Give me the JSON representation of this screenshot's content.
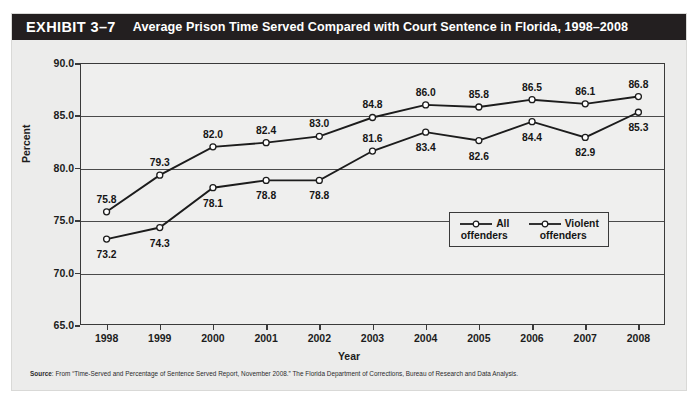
{
  "exhibit": {
    "label": "EXHIBIT 3–7",
    "title": "Average Prison Time Served Compared with Court Sentence in Florida, 1998–2008"
  },
  "source": {
    "prefix": "Source",
    "text": ": From “Time-Served and Percentage of Sentence Served Report, November 2008.” The Florida Department of Corrections, Bureau of Research and Data Analysis."
  },
  "chart_data": {
    "type": "line",
    "title": "Average Prison Time Served Compared with Court Sentence in Florida, 1998–2008",
    "xlabel": "Year",
    "ylabel": "Percent",
    "categories": [
      "1998",
      "1999",
      "2000",
      "2001",
      "2002",
      "2003",
      "2004",
      "2005",
      "2006",
      "2007",
      "2008"
    ],
    "ylim": [
      65.0,
      90.0
    ],
    "yticks": [
      "65.0",
      "70.0",
      "75.0",
      "80.0",
      "85.0",
      "90.0"
    ],
    "ytick_values": [
      65.0,
      70.0,
      75.0,
      80.0,
      85.0,
      90.0
    ],
    "grid": true,
    "legend_position": "lower-right-inside",
    "marker": "open-circle",
    "series": [
      {
        "name": "All offenders",
        "values": [
          75.8,
          79.3,
          82.0,
          82.4,
          83.0,
          84.8,
          86.0,
          85.8,
          86.5,
          86.1,
          86.8
        ],
        "labels": [
          "75.8",
          "79.3",
          "82.0",
          "82.4",
          "83.0",
          "84.8",
          "86.0",
          "85.8",
          "86.5",
          "86.1",
          "86.8"
        ],
        "label_side": [
          "above",
          "above",
          "above",
          "above",
          "above",
          "above",
          "above",
          "above",
          "above",
          "above",
          "above"
        ],
        "color": "#1c1c1c"
      },
      {
        "name": "Violent offenders",
        "values": [
          73.2,
          74.3,
          78.1,
          78.8,
          78.8,
          81.6,
          83.4,
          82.6,
          84.4,
          82.9,
          85.3
        ],
        "labels": [
          "73.2",
          "74.3",
          "78.1",
          "78.8",
          "78.8",
          "81.6",
          "83.4",
          "82.6",
          "84.4",
          "82.9",
          "85.3"
        ],
        "label_side": [
          "below",
          "below",
          "below",
          "below",
          "below",
          "above",
          "below",
          "below",
          "below",
          "below",
          "below"
        ],
        "color": "#1c1c1c"
      }
    ]
  },
  "legend": {
    "entries": [
      {
        "line1": "All",
        "line2": "offenders"
      },
      {
        "line1": "Violent",
        "line2": "offenders"
      }
    ]
  },
  "colors": {
    "header_bg": "#231f20",
    "header_text": "#ffffff",
    "panel_bg": "#ececeb",
    "plot_bg": "#efefee",
    "axis": "#3a3a3a",
    "series": "#1c1c1c"
  }
}
